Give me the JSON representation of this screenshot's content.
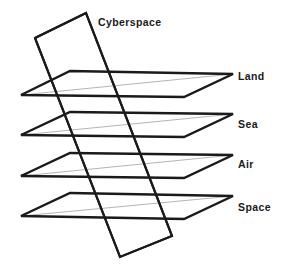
{
  "diagram": {
    "type": "layered-planes-diagram",
    "background_color": "#ffffff",
    "stroke_color": "#1a1a1a",
    "faint_stroke_color": "#b5b5b5",
    "label_color": "#1a1a1a",
    "vertical_plane": {
      "label": "Cyberspace",
      "label_x": 98,
      "label_y": 17,
      "points": "35,38 86,13 172,236 120,257",
      "stroke_width": 2.1
    },
    "horizontal_planes": [
      {
        "label": "Land",
        "label_x": 238,
        "label_y": 71,
        "points": "21,95 70,71 233,74 184,97",
        "diagonal": "21,95 233,74",
        "stroke_width": 2.4
      },
      {
        "label": "Sea",
        "label_x": 238,
        "label_y": 119,
        "points": "21,135 70,112 233,114 184,137",
        "diagonal": "21,135 233,114",
        "stroke_width": 2.4
      },
      {
        "label": "Air",
        "label_x": 238,
        "label_y": 159,
        "points": "21,176 70,153 233,155 184,178",
        "diagonal": "21,176 233,155",
        "stroke_width": 2.4
      },
      {
        "label": "Space",
        "label_x": 238,
        "label_y": 202,
        "points": "21,216 70,193 233,196 184,219",
        "diagonal": "21,216 233,196",
        "stroke_width": 2.4
      }
    ]
  }
}
